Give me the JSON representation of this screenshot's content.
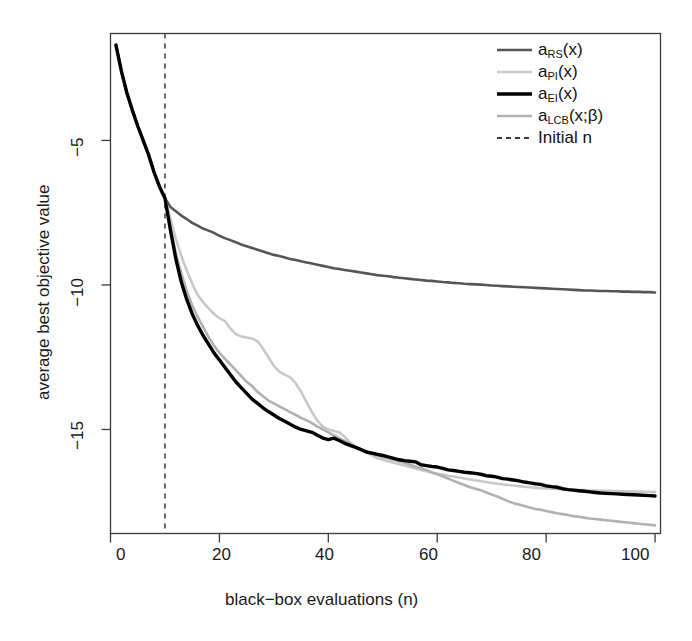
{
  "chart_data": {
    "type": "line",
    "title": "",
    "xlabel": "black−box evaluations (n)",
    "ylabel": "average best objective value",
    "xlim": [
      0,
      101
    ],
    "ylim": [
      -18.6,
      -1.3
    ],
    "xticks": [
      0,
      20,
      40,
      60,
      80,
      100
    ],
    "yticks": [
      -5,
      -10,
      -15
    ],
    "xtick_labels": [
      "0",
      "20",
      "40",
      "60",
      "80",
      "100"
    ],
    "ytick_labels": [
      "-5",
      "-10",
      "-15"
    ],
    "grid": false,
    "legend_position": "top-right",
    "annotations": [
      {
        "name": "initial-design-marker",
        "type": "vline",
        "x": 10,
        "label": "Initial n",
        "style": "dashed"
      }
    ],
    "x": [
      1,
      2,
      3,
      4,
      5,
      6,
      7,
      8,
      9,
      10,
      11,
      12,
      13,
      14,
      15,
      16,
      17,
      18,
      19,
      20,
      21,
      22,
      23,
      24,
      25,
      26,
      27,
      28,
      29,
      30,
      31,
      32,
      33,
      34,
      35,
      36,
      37,
      38,
      39,
      40,
      41,
      42,
      43,
      44,
      45,
      46,
      47,
      48,
      49,
      50,
      51,
      52,
      53,
      54,
      55,
      56,
      57,
      58,
      59,
      60,
      61,
      62,
      63,
      64,
      65,
      66,
      67,
      68,
      69,
      70,
      71,
      72,
      73,
      74,
      75,
      76,
      77,
      78,
      79,
      80,
      81,
      82,
      83,
      84,
      85,
      86,
      87,
      88,
      89,
      90,
      91,
      92,
      93,
      94,
      95,
      96,
      97,
      98,
      99,
      100
    ],
    "series": [
      {
        "name": "a_RS(x)",
        "legend": "aRS(x)",
        "color": "#555555",
        "width": 2.6,
        "dash": "none",
        "values": [
          -1.7,
          -2.6,
          -3.35,
          -3.95,
          -4.5,
          -5.0,
          -5.5,
          -6.1,
          -6.6,
          -7.0,
          -7.3,
          -7.45,
          -7.6,
          -7.72,
          -7.85,
          -7.95,
          -8.05,
          -8.12,
          -8.2,
          -8.3,
          -8.38,
          -8.45,
          -8.52,
          -8.6,
          -8.66,
          -8.72,
          -8.78,
          -8.84,
          -8.9,
          -8.96,
          -9.0,
          -9.05,
          -9.1,
          -9.14,
          -9.18,
          -9.22,
          -9.26,
          -9.3,
          -9.34,
          -9.38,
          -9.42,
          -9.45,
          -9.48,
          -9.51,
          -9.54,
          -9.57,
          -9.6,
          -9.63,
          -9.66,
          -9.68,
          -9.7,
          -9.73,
          -9.75,
          -9.77,
          -9.79,
          -9.81,
          -9.83,
          -9.85,
          -9.86,
          -9.88,
          -9.9,
          -9.91,
          -9.93,
          -9.94,
          -9.96,
          -9.97,
          -9.98,
          -9.99,
          -10.0,
          -10.02,
          -10.03,
          -10.04,
          -10.05,
          -10.06,
          -10.07,
          -10.08,
          -10.09,
          -10.1,
          -10.11,
          -10.12,
          -10.13,
          -10.14,
          -10.15,
          -10.16,
          -10.17,
          -10.18,
          -10.19,
          -10.19,
          -10.2,
          -10.21,
          -10.21,
          -10.22,
          -10.22,
          -10.23,
          -10.23,
          -10.24,
          -10.24,
          -10.25,
          -10.25,
          -10.26
        ]
      },
      {
        "name": "a_PI(x)",
        "legend": "aPI(x)",
        "color": "#c8c8c8",
        "width": 2.6,
        "dash": "none",
        "values": [
          -1.7,
          -2.6,
          -3.35,
          -3.95,
          -4.5,
          -5.0,
          -5.5,
          -6.1,
          -6.6,
          -7.0,
          -7.7,
          -8.4,
          -9.0,
          -9.5,
          -9.95,
          -10.35,
          -10.6,
          -10.8,
          -11.0,
          -11.15,
          -11.25,
          -11.5,
          -11.7,
          -11.78,
          -11.82,
          -11.85,
          -11.95,
          -12.2,
          -12.5,
          -12.8,
          -13.0,
          -13.1,
          -13.2,
          -13.4,
          -13.7,
          -14.05,
          -14.4,
          -14.7,
          -14.9,
          -15.0,
          -15.05,
          -15.1,
          -15.25,
          -15.45,
          -15.6,
          -15.7,
          -15.8,
          -15.9,
          -16.0,
          -16.05,
          -16.1,
          -16.15,
          -16.2,
          -16.25,
          -16.3,
          -16.35,
          -16.4,
          -16.45,
          -16.5,
          -16.53,
          -16.56,
          -16.6,
          -16.63,
          -16.66,
          -16.7,
          -16.73,
          -16.76,
          -16.79,
          -16.82,
          -16.85,
          -16.88,
          -16.9,
          -16.92,
          -16.94,
          -16.96,
          -16.98,
          -17.0,
          -17.02,
          -17.03,
          -17.04,
          -17.05,
          -17.06,
          -17.07,
          -17.08,
          -17.09,
          -17.1,
          -17.1,
          -17.11,
          -17.11,
          -17.12,
          -17.12,
          -17.13,
          -17.13,
          -17.14,
          -17.14,
          -17.15,
          -17.15,
          -17.16,
          -17.16,
          -17.17
        ]
      },
      {
        "name": "a_EI(x)",
        "legend": "aEI(x)",
        "color": "#000000",
        "width": 3.4,
        "dash": "none",
        "values": [
          -1.7,
          -2.6,
          -3.35,
          -3.95,
          -4.5,
          -5.0,
          -5.5,
          -6.1,
          -6.6,
          -7.0,
          -8.1,
          -9.1,
          -9.9,
          -10.5,
          -11.0,
          -11.4,
          -11.75,
          -12.05,
          -12.35,
          -12.6,
          -12.85,
          -13.1,
          -13.35,
          -13.55,
          -13.75,
          -13.95,
          -14.1,
          -14.25,
          -14.38,
          -14.5,
          -14.62,
          -14.72,
          -14.82,
          -14.92,
          -15.0,
          -15.05,
          -15.1,
          -15.2,
          -15.3,
          -15.35,
          -15.3,
          -15.38,
          -15.48,
          -15.55,
          -15.62,
          -15.7,
          -15.78,
          -15.82,
          -15.86,
          -15.9,
          -15.95,
          -16.0,
          -16.05,
          -16.08,
          -16.1,
          -16.12,
          -16.22,
          -16.25,
          -16.28,
          -16.3,
          -16.35,
          -16.4,
          -16.42,
          -16.45,
          -16.48,
          -16.5,
          -16.52,
          -16.55,
          -16.6,
          -16.62,
          -16.65,
          -16.7,
          -16.72,
          -16.75,
          -16.78,
          -16.82,
          -16.85,
          -16.88,
          -16.9,
          -16.95,
          -16.98,
          -17.0,
          -17.05,
          -17.08,
          -17.1,
          -17.12,
          -17.14,
          -17.16,
          -17.18,
          -17.2,
          -17.21,
          -17.22,
          -17.23,
          -17.24,
          -17.25,
          -17.26,
          -17.27,
          -17.28,
          -17.29,
          -17.3
        ]
      },
      {
        "name": "a_LCB(x;beta)",
        "legend": "aLCB(x;β)",
        "color": "#b0b0b0",
        "width": 2.6,
        "dash": "none",
        "values": [
          -1.7,
          -2.6,
          -3.35,
          -3.95,
          -4.5,
          -5.0,
          -5.5,
          -6.1,
          -6.6,
          -7.0,
          -8.0,
          -8.9,
          -9.6,
          -10.2,
          -10.7,
          -11.1,
          -11.45,
          -11.8,
          -12.1,
          -12.35,
          -12.55,
          -12.75,
          -12.95,
          -13.15,
          -13.35,
          -13.5,
          -13.7,
          -13.85,
          -14.0,
          -14.1,
          -14.2,
          -14.3,
          -14.4,
          -14.5,
          -14.6,
          -14.68,
          -14.78,
          -14.9,
          -15.0,
          -15.1,
          -15.2,
          -15.3,
          -15.4,
          -15.5,
          -15.6,
          -15.68,
          -15.76,
          -15.84,
          -15.9,
          -15.95,
          -16.0,
          -16.05,
          -16.1,
          -16.15,
          -16.22,
          -16.28,
          -16.34,
          -16.4,
          -16.48,
          -16.55,
          -16.62,
          -16.7,
          -16.78,
          -16.85,
          -16.92,
          -17.0,
          -17.05,
          -17.1,
          -17.18,
          -17.25,
          -17.32,
          -17.4,
          -17.48,
          -17.55,
          -17.6,
          -17.65,
          -17.7,
          -17.75,
          -17.78,
          -17.82,
          -17.86,
          -17.9,
          -17.93,
          -17.96,
          -18.0,
          -18.02,
          -18.05,
          -18.08,
          -18.1,
          -18.12,
          -18.14,
          -18.16,
          -18.18,
          -18.2,
          -18.22,
          -18.24,
          -18.26,
          -18.28,
          -18.3,
          -18.32
        ]
      }
    ]
  },
  "legend": {
    "entries": [
      {
        "label_main": "a",
        "label_sub": "RS",
        "label_tail": "(x)",
        "key": "rs"
      },
      {
        "label_main": "a",
        "label_sub": "PI",
        "label_tail": "(x)",
        "key": "pi"
      },
      {
        "label_main": "a",
        "label_sub": "EI",
        "label_tail": "(x)",
        "key": "ei"
      },
      {
        "label_main": "a",
        "label_sub": "LCB",
        "label_tail": "(x;β)",
        "key": "lcb"
      },
      {
        "label_main": "Initial n",
        "label_sub": "",
        "label_tail": "",
        "key": "initial"
      }
    ],
    "rs_text": "aRS(x)",
    "pi_text": "aPI(x)",
    "ei_text": "aEI(x)",
    "lcb_text": "aLCB(x;β)",
    "initial_text": "Initial n"
  },
  "axes": {
    "xlabel": "black−box evaluations (n)",
    "ylabel": "average best objective value",
    "xtick_0": "0",
    "xtick_20": "20",
    "xtick_40": "40",
    "xtick_60": "60",
    "xtick_80": "80",
    "xtick_100": "100",
    "ytick_5": "−5",
    "ytick_10": "−10",
    "ytick_15": "−15"
  },
  "colors": {
    "rs": "#555555",
    "pi": "#c8c8c8",
    "ei": "#000000",
    "lcb": "#b0b0b0",
    "vline": "#3a3a3a",
    "axis": "#3a3a3a",
    "background": "#ffffff"
  }
}
